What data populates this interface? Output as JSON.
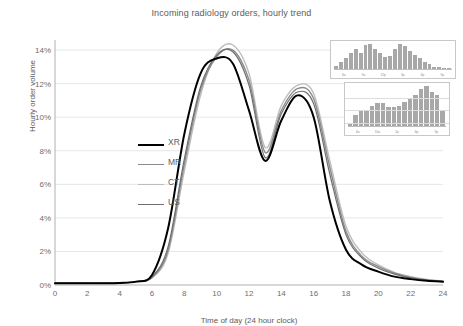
{
  "chart_data": {
    "type": "line",
    "title": "Incoming radiology orders, hourly trend",
    "xlabel": "Time of day (24 hour clock)",
    "ylabel": "Hourly order volume",
    "xlim": [
      0,
      24
    ],
    "ylim": [
      0,
      14.6
    ],
    "grid": true,
    "legend_position": "center-left",
    "xticks": [
      0,
      2,
      4,
      6,
      8,
      10,
      12,
      14,
      16,
      18,
      20,
      22,
      24
    ],
    "xtick_labels": [
      "0",
      "2",
      "4",
      "6",
      "8",
      "10",
      "12",
      "14",
      "16",
      "18",
      "20",
      "22",
      "24"
    ],
    "yticks": [
      0,
      2,
      4,
      6,
      8,
      10,
      12,
      14
    ],
    "ytick_labels": [
      "0%",
      "2%",
      "4%",
      "6%",
      "8%",
      "10%",
      "12%",
      "14%"
    ],
    "x": [
      0,
      1,
      2,
      3,
      4,
      5,
      6,
      7,
      8,
      9,
      10,
      11,
      12,
      13,
      14,
      15,
      16,
      17,
      18,
      19,
      20,
      21,
      22,
      23,
      24
    ],
    "series": [
      {
        "name": "XR",
        "color": "#000000",
        "width": 2.0,
        "values": [
          0.1,
          0.1,
          0.1,
          0.1,
          0.12,
          0.2,
          0.6,
          3.4,
          9.0,
          12.6,
          13.5,
          13.2,
          10.4,
          7.4,
          9.8,
          11.3,
          10.0,
          5.0,
          2.1,
          1.2,
          0.8,
          0.5,
          0.35,
          0.25,
          0.2
        ]
      },
      {
        "name": "MR",
        "color": "#8a8a8a",
        "width": 1.4,
        "values": [
          0.1,
          0.1,
          0.1,
          0.1,
          0.12,
          0.2,
          0.45,
          2.1,
          7.2,
          11.6,
          13.6,
          14.0,
          12.2,
          7.9,
          10.4,
          11.7,
          11.1,
          7.0,
          3.2,
          1.7,
          1.1,
          0.7,
          0.45,
          0.3,
          0.22
        ]
      },
      {
        "name": "CT",
        "color": "#bcbcbc",
        "width": 1.4,
        "values": [
          0.1,
          0.1,
          0.1,
          0.1,
          0.12,
          0.2,
          0.42,
          1.9,
          6.8,
          11.3,
          13.8,
          14.3,
          12.6,
          8.2,
          10.7,
          11.9,
          11.4,
          7.4,
          3.5,
          1.9,
          1.2,
          0.75,
          0.5,
          0.33,
          0.24
        ]
      },
      {
        "name": "US",
        "color": "#6f6f6f",
        "width": 1.2,
        "values": [
          0.1,
          0.1,
          0.1,
          0.1,
          0.12,
          0.2,
          0.48,
          2.3,
          7.5,
          11.8,
          13.7,
          13.9,
          11.9,
          7.6,
          10.2,
          11.5,
          10.8,
          6.6,
          3.0,
          1.6,
          1.0,
          0.65,
          0.42,
          0.28,
          0.2
        ]
      }
    ],
    "legend_entries": [
      {
        "label": "XR",
        "color": "#000000"
      },
      {
        "label": "MR",
        "color": "#8a8a8a"
      },
      {
        "label": "CT",
        "color": "#bcbcbc"
      },
      {
        "label": "US",
        "color": "#6f6f6f"
      }
    ],
    "insets": [
      {
        "name": "inset-histogram-top",
        "type": "bar",
        "bar_color": "#a8a8a8",
        "grid": false,
        "tick_labels": [
          "6a",
          "9a",
          "12p",
          "3p",
          "6p",
          "9p"
        ],
        "values": [
          12,
          26,
          40,
          58,
          72,
          58,
          84,
          88,
          70,
          58,
          44,
          46,
          70,
          88,
          82,
          62,
          48,
          38,
          26,
          16,
          8,
          6,
          4,
          3
        ]
      },
      {
        "name": "inset-histogram-bottom",
        "type": "bar",
        "bar_color": "#a8a8a8",
        "grid": true,
        "tick_labels": [
          "6a",
          "10a",
          "2p",
          "6p",
          "9p"
        ],
        "values": [
          4,
          26,
          34,
          36,
          46,
          52,
          52,
          44,
          44,
          46,
          56,
          62,
          72,
          84,
          92,
          78,
          72,
          36
        ]
      }
    ]
  },
  "axis_colors": {
    "grid": "#e6e6e6",
    "axis": "#b0b0b0",
    "text": "#6e6e6e"
  }
}
